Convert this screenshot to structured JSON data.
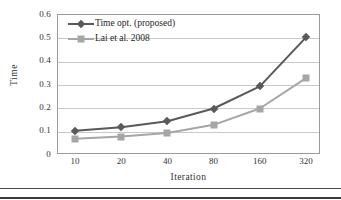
{
  "chart_data": {
    "type": "line",
    "title": "",
    "xlabel": "Iteration",
    "ylabel": "Time",
    "categories": [
      "10",
      "20",
      "40",
      "80",
      "160",
      "320"
    ],
    "x": [
      10,
      20,
      40,
      80,
      160,
      320
    ],
    "x_scale": "categorical",
    "ylim": [
      0,
      0.6
    ],
    "ytick_labels": [
      "0",
      "0.1",
      "0.2",
      "0.3",
      "0.4",
      "0.5",
      "0.6"
    ],
    "ytick_values": [
      0,
      0.1,
      0.2,
      0.3,
      0.4,
      0.5,
      0.6
    ],
    "grid": "horizontal",
    "legend_position": "top-left-inside",
    "series": [
      {
        "name": "Time opt. (proposed)",
        "values": [
          0.1,
          0.115,
          0.14,
          0.195,
          0.29,
          0.5
        ],
        "color": "#595959",
        "marker": "diamond"
      },
      {
        "name": "Lai et al. 2008",
        "values": [
          0.065,
          0.075,
          0.09,
          0.125,
          0.195,
          0.325
        ],
        "color": "#a6a6a6",
        "marker": "square"
      }
    ]
  },
  "axes": {
    "y_title": "Time",
    "x_title": "Iteration"
  },
  "colors": {
    "series1": "#595959",
    "series2": "#a6a6a6",
    "gridline": "#c9c9c9",
    "frame": "#9a9a9a",
    "text": "#333333",
    "rule": "#4a4a4a"
  }
}
